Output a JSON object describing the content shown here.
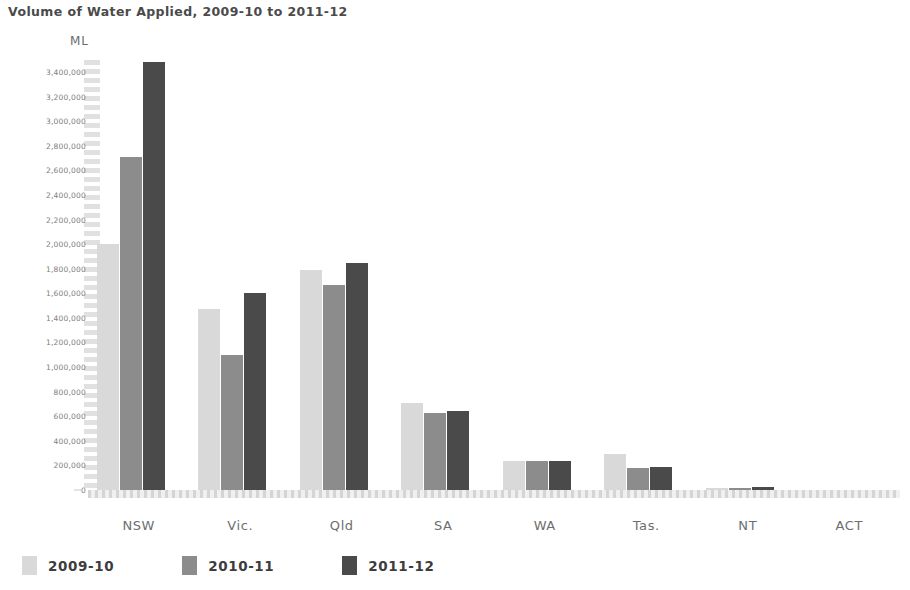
{
  "chart_data": {
    "type": "bar",
    "title": "Volume of Water Applied, 2009-10 to 2011-12",
    "xlabel": "",
    "ylabel": "ML",
    "unit_label": "ML",
    "grid": false,
    "legend_position": "bottom-left",
    "ylim": [
      0,
      3400000
    ],
    "ytick_step": 200000,
    "ytick_labels": [
      "3,400,000",
      "3,200,000",
      "3,000,000",
      "2,800,000",
      "2,600,000",
      "2,400,000",
      "2,200,000",
      "2,000,000",
      "1,800,000",
      "1,600,000",
      "1,400,000",
      "1,200,000",
      "1,000,000",
      "800,000",
      "600,000",
      "400,000",
      "200,000",
      "0"
    ],
    "ytick_values": [
      3400000,
      3200000,
      3000000,
      2800000,
      2600000,
      2400000,
      2200000,
      2000000,
      1800000,
      1600000,
      1400000,
      1200000,
      1000000,
      800000,
      600000,
      400000,
      200000,
      0
    ],
    "categories": [
      "NSW",
      "Vic.",
      "Qld",
      "SA",
      "WA",
      "Tas.",
      "NT",
      "ACT"
    ],
    "series": [
      {
        "name": "2009-10",
        "color": "#d9d9d9",
        "values": [
          2000000,
          1470000,
          1790000,
          710000,
          235000,
          290000,
          18000,
          4000
        ]
      },
      {
        "name": "2010-11",
        "color": "#8c8c8c",
        "values": [
          2710000,
          1100000,
          1670000,
          630000,
          235000,
          180000,
          18000,
          4000
        ]
      },
      {
        "name": "2011-12",
        "color": "#4a4a4a",
        "values": [
          3480000,
          1600000,
          1850000,
          640000,
          235000,
          185000,
          22000,
          4000
        ]
      }
    ]
  }
}
